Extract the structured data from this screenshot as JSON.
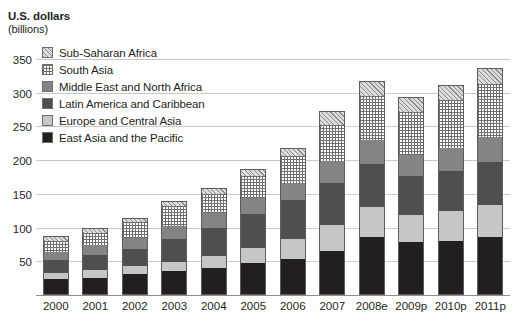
{
  "title": {
    "main": "U.S. dollars",
    "sub": "(billions)"
  },
  "legend": {
    "items": [
      {
        "label": "Sub-Saharan Africa",
        "key": "ssa",
        "swatch": "diagonal-hatch",
        "color": "#dcdcdc"
      },
      {
        "label": "South Asia",
        "key": "sa",
        "swatch": "dotted-grid",
        "color": "#ffffff"
      },
      {
        "label": "Middle East and North Africa",
        "key": "mena",
        "swatch": "solid",
        "color": "#848484"
      },
      {
        "label": "Latin America and Caribbean",
        "key": "lac",
        "swatch": "solid",
        "color": "#4f4f4f"
      },
      {
        "label": "Europe and Central Asia",
        "key": "eca",
        "swatch": "solid",
        "color": "#c6c6c6"
      },
      {
        "label": "East Asia and the Pacific",
        "key": "eap",
        "swatch": "solid",
        "color": "#231f20"
      }
    ]
  },
  "chart_data": {
    "type": "bar",
    "subtype": "stacked-column",
    "title": "U.S. dollars (billions)",
    "xlabel": "",
    "ylabel": "U.S. dollars (billions)",
    "ylim": [
      0,
      360
    ],
    "ytick_values": [
      50,
      100,
      150,
      200,
      250,
      300,
      350
    ],
    "ytick_labels": [
      "50",
      "100",
      "150",
      "200",
      "250",
      "300",
      "350"
    ],
    "grid": true,
    "grid_axis": "y",
    "legend_position": "upper-left",
    "categories": [
      "2000",
      "2001",
      "2002",
      "2003",
      "2004",
      "2005",
      "2006",
      "2007",
      "2008e",
      "2009p",
      "2010p",
      "2011p"
    ],
    "series": [
      {
        "name": "East Asia and the Pacific",
        "values": [
          23,
          24,
          30,
          35,
          39,
          47,
          53,
          65,
          85,
          78,
          80,
          85
        ]
      },
      {
        "name": "Europe and Central Asia",
        "values": [
          9,
          12,
          12,
          13,
          19,
          23,
          29,
          39,
          45,
          40,
          44,
          48
        ]
      },
      {
        "name": "Latin America and Caribbean",
        "values": [
          20,
          24,
          27,
          35,
          41,
          50,
          59,
          63,
          65,
          58,
          60,
          65
        ]
      },
      {
        "name": "Middle East and North Africa",
        "values": [
          13,
          15,
          16,
          20,
          23,
          24,
          26,
          32,
          35,
          32,
          34,
          36
        ]
      },
      {
        "name": "South Asia",
        "values": [
          17,
          19,
          24,
          31,
          29,
          34,
          40,
          54,
          66,
          65,
          72,
          80
        ]
      },
      {
        "name": "Sub-Saharan Africa",
        "values": [
          5,
          5,
          5,
          6,
          8,
          9,
          11,
          19,
          21,
          20,
          21,
          22
        ]
      }
    ],
    "totals": [
      87,
      99,
      114,
      140,
      159,
      187,
      218,
      272,
      317,
      293,
      311,
      336
    ]
  }
}
